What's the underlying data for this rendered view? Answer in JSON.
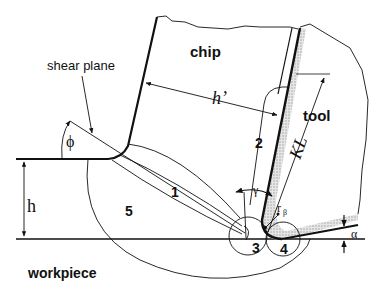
{
  "diagram": {
    "type": "orthogonal-cutting-deformation-zones",
    "colors": {
      "line": "#111111",
      "tool_coating": "#c8c8c8",
      "background": "#ffffff"
    },
    "labels": {
      "chip": "chip",
      "tool": "tool",
      "workpiece": "workpiece",
      "shear_plane": "shear plane",
      "phi": "ϕ",
      "h": "h",
      "h_prime": "h’",
      "KL": "KL",
      "gamma": "γ",
      "r_beta": "r",
      "r_beta_sub": "β",
      "alpha": "α"
    },
    "zones": [
      {
        "id": "1",
        "label": "1"
      },
      {
        "id": "2",
        "label": "2"
      },
      {
        "id": "3",
        "label": "3"
      },
      {
        "id": "4",
        "label": "4"
      },
      {
        "id": "5",
        "label": "5"
      }
    ]
  }
}
